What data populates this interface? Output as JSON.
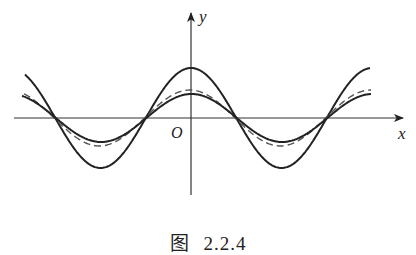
{
  "chart_data": {
    "type": "line",
    "title": "",
    "caption": "图 2.2.4",
    "caption_parts": {
      "prefix": "图",
      "number": "2.2.4"
    },
    "xlabel": "x",
    "ylabel": "y",
    "origin_label": "O",
    "grid": false,
    "legend": null,
    "axes": {
      "x_range_px": [
        14,
        403
      ],
      "y_range_px": [
        12,
        195
      ],
      "origin_px": [
        191,
        118
      ]
    },
    "series": [
      {
        "name": "large-amplitude curve",
        "style": "solid",
        "amplitude_rel": 1.0,
        "peak_at_x": 0,
        "approx_form": "A·cos(ω(x))"
      },
      {
        "name": "dashed curve",
        "style": "dashed",
        "amplitude_rel": 0.56,
        "peak_at_x": 0
      },
      {
        "name": "small-amplitude curve",
        "style": "solid",
        "amplitude_rel": 0.48,
        "peak_at_x": 0
      }
    ],
    "shared_zero_crossings_px": [
      62,
      151,
      243,
      328
    ],
    "period_px": 181
  },
  "labels": {
    "x": "x",
    "y": "y",
    "origin": "O"
  },
  "caption": {
    "prefix": "图",
    "number": "2.2.4"
  }
}
